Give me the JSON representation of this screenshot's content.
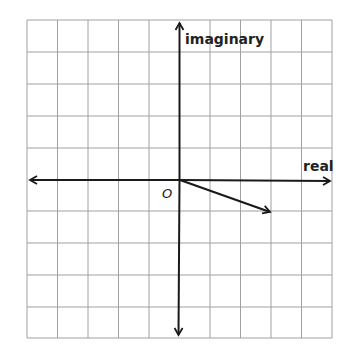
{
  "diagram": {
    "type": "complex-plane",
    "axes": {
      "horizontal_label": "real",
      "vertical_label": "imaginary",
      "origin_label": "O"
    },
    "grid": {
      "columns": 10,
      "rows": 10,
      "x_range": [
        -5,
        5
      ],
      "y_range": [
        -5,
        5
      ]
    },
    "vectors": [
      {
        "from": [
          0,
          0
        ],
        "to": [
          3,
          -1
        ],
        "label": ""
      }
    ],
    "colors": {
      "grid": "#9a9a9a",
      "axis": "#1a1a1a",
      "vector": "#1a1a1a"
    }
  }
}
